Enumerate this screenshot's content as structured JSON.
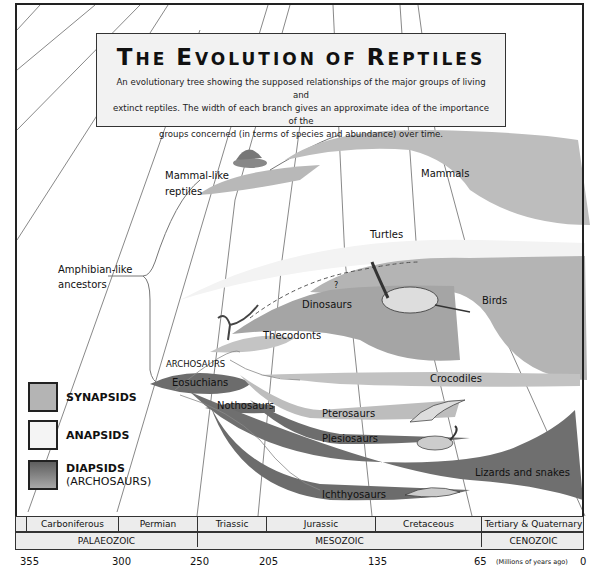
{
  "header": {
    "title": "The Evolution of Reptiles",
    "title_parts": [
      "T",
      "HE ",
      "E",
      "VOLUTION OF ",
      "R",
      "EPTILES"
    ],
    "description_lines": [
      "An evolutionary tree showing the supposed relationships of the major groups of living and",
      "extinct reptiles. The width of each branch gives an approximate idea of the importance of the",
      "groups concerned (in terms of species and abundance) over time."
    ]
  },
  "groups": {
    "ancestor_line1": "Amphibian-like",
    "ancestor_line2": "ancestors",
    "mammal_like_line1": "Mammal-like",
    "mammal_like_line2": "reptiles",
    "mammals": "Mammals",
    "turtles": "Turtles",
    "dinosaurs": "Dinosaurs",
    "birds": "Birds",
    "question": "?",
    "thecodonts": "Thecodonts",
    "archosaurs": "ARCHOSAURS",
    "eosuchians": "Eosuchians",
    "nothosaurs": "Nothosaurs",
    "crocodiles": "Crocodiles",
    "pterosaurs": "Pterosaurs",
    "plesiosaurs": "Plesiosaurs",
    "lizards_snakes": "Lizards and snakes",
    "ichthyosaurs": "Ichthyosaurs"
  },
  "legend": {
    "items": [
      {
        "label": "SYNAPSIDS",
        "sub": "",
        "color": "#b4b4b4"
      },
      {
        "label": "ANAPSIDS",
        "sub": "",
        "color": "#f4f4f4"
      },
      {
        "label": "DIAPSIDS",
        "sub": "(ARCHOSAURS)",
        "color": "#6e6e6e"
      }
    ]
  },
  "timescale": {
    "periods": [
      "",
      "Carboniferous",
      "Permian",
      "Triassic",
      "Jurassic",
      "Cretaceous",
      "Tertiary & Quaternary"
    ],
    "eras": [
      "PALAEOZOIC",
      "MESOZOIC",
      "CENOZOIC"
    ],
    "ticks": [
      "355",
      "300",
      "250",
      "205",
      "135",
      "65",
      "0"
    ],
    "unit": "(Millions of years ago)"
  },
  "colors": {
    "synapsid": "#b4b4b4",
    "anapsid": "#f2f2f2",
    "diapsid": "#707070",
    "dinosaur": "#a8a8a8",
    "frame": "#222222"
  }
}
